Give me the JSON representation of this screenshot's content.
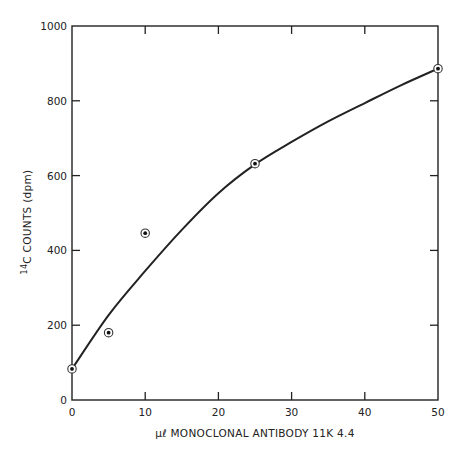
{
  "chart_data": {
    "type": "scatter",
    "title": "",
    "xlabel": "μℓ MONOCLONAL ANTIBODY 11K 4.4",
    "ylabel_sup": "14",
    "ylabel_main": "C COUNTS (dpm)",
    "ylabel": "14C COUNTS (dpm)",
    "xlim": [
      0,
      50
    ],
    "ylim": [
      0,
      1000
    ],
    "x_ticks": [
      0,
      10,
      20,
      30,
      40,
      50
    ],
    "y_ticks": [
      0,
      200,
      400,
      600,
      800,
      1000
    ],
    "x_tick_labels": [
      "0",
      "10",
      "20",
      "30",
      "40",
      "50"
    ],
    "y_tick_labels": [
      "0",
      "200",
      "400",
      "600",
      "800",
      "1000"
    ],
    "grid": false,
    "legend": null,
    "series": [
      {
        "name": "measured points",
        "kind": "scatter",
        "marker": "circled-dot",
        "x": [
          0,
          5,
          10,
          25,
          50
        ],
        "y": [
          83,
          180,
          446,
          632,
          886
        ]
      },
      {
        "name": "fitted curve",
        "kind": "line",
        "x": [
          0,
          5,
          10,
          15,
          20,
          25,
          30,
          35,
          40,
          45,
          50
        ],
        "y": [
          83,
          227,
          345,
          455,
          553,
          630,
          690,
          745,
          794,
          842,
          886
        ]
      }
    ]
  }
}
